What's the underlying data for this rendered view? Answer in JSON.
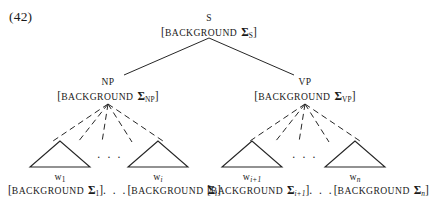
{
  "figure": {
    "example_number": "(42)",
    "type": "syntax-tree",
    "nodes": {
      "root": {
        "category": "S",
        "feature_open": "[",
        "feature_word": "BACKGROUND",
        "feature_sigma": "Σ",
        "feature_subscript": "S",
        "feature_close": "]",
        "feature_full": "[BACKGROUND ΣS]"
      },
      "np": {
        "category": "NP",
        "feature_open": "[",
        "feature_word": "BACKGROUND",
        "feature_sigma": "Σ",
        "feature_subscript": "NP",
        "feature_close": "]",
        "feature_full": "[BACKGROUND ΣNP]"
      },
      "vp": {
        "category": "VP",
        "feature_open": "[",
        "feature_word": "BACKGROUND",
        "feature_sigma": "Σ",
        "feature_subscript": "VP",
        "feature_close": "]",
        "feature_full": "[BACKGROUND ΣVP]"
      }
    },
    "terminals": [
      {
        "id": "w1",
        "word": "w",
        "word_subscript": "1",
        "feature_open": "[",
        "feature_word": "BACKGROUND",
        "feature_sigma": "Σ",
        "feature_subscript": "1",
        "feature_close": "]",
        "feature_full": "[BACKGROUND Σ1]"
      },
      {
        "id": "wi",
        "word": "w",
        "word_subscript": "i",
        "feature_open": "[",
        "feature_word": "BACKGROUND",
        "feature_sigma": "Σ",
        "feature_subscript": "i",
        "feature_close": "]",
        "feature_full": "[BACKGROUND Σi]"
      },
      {
        "id": "wi1",
        "word": "w",
        "word_subscript": "i+1",
        "feature_open": "[",
        "feature_word": "BACKGROUND",
        "feature_sigma": "Σ",
        "feature_subscript": "i+1",
        "feature_close": "]",
        "feature_full": "[BACKGROUND Σi+1]"
      },
      {
        "id": "wn",
        "word": "w",
        "word_subscript": "n",
        "feature_open": "[",
        "feature_word": "BACKGROUND",
        "feature_sigma": "Σ",
        "feature_subscript": "n",
        "feature_close": "]",
        "feature_full": "[BACKGROUND Σn]"
      }
    ],
    "ellipsis": {
      "np_children": ". . .",
      "vp_children": ". . .",
      "np_features": ". . .",
      "vp_features": ". . ."
    },
    "colors": {
      "ink": "#1a1a1a",
      "background": "#ffffff",
      "line": "#262626"
    }
  }
}
